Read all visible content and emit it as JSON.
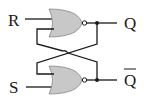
{
  "diagram": {
    "labels": {
      "input_r": "R",
      "input_s": "S",
      "output_q": "Q",
      "output_q_bar": "Q"
    },
    "gates": [
      {
        "type": "NOR",
        "position": "top",
        "inputs": [
          "R",
          "feedback from Q-bar"
        ],
        "output": "Q"
      },
      {
        "type": "NOR",
        "position": "bottom",
        "inputs": [
          "feedback from Q",
          "S"
        ],
        "output": "Q-bar"
      }
    ],
    "colors": {
      "gate_fill": "#c8c8c8",
      "wire": "#1a1a1a",
      "background": "#ffffff"
    }
  }
}
